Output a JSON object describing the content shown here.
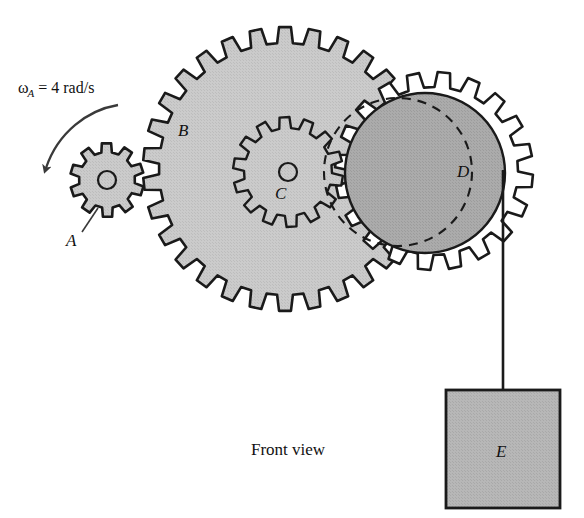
{
  "figure": {
    "caption": "Front view",
    "angular_velocity_label": {
      "symbol": "ω",
      "subscript": "A",
      "equals_value": "= 4 rad/s",
      "full_text": "ωA = 4 rad/s"
    },
    "labels": {
      "gear_a": "A",
      "gear_b": "B",
      "gear_c": "C",
      "drum_d": "D",
      "block_e": "E"
    },
    "colors": {
      "outline": "#1a1a1a",
      "gear_fill": "#c8c8c8",
      "drum_fill": "#a8a8a8",
      "block_fill": "#b4b4b4",
      "background": "#ffffff"
    },
    "components": [
      {
        "name": "gear-a",
        "label": "A",
        "teeth": 10,
        "center_x": 107,
        "center_y": 180,
        "outer_radius": 37,
        "root_radius": 28,
        "hub_radius": 9,
        "fill": "#c8c8c8"
      },
      {
        "name": "gear-b",
        "label": "B",
        "teeth": 30,
        "center_x": 285,
        "center_y": 169,
        "outer_radius": 142,
        "root_radius": 126,
        "fill": "#c8c8c8"
      },
      {
        "name": "gear-c",
        "label": "C",
        "teeth": 14,
        "center_x": 288,
        "center_y": 177,
        "outer_radius": 55,
        "root_radius": 44,
        "hub_radius": 8,
        "fill": "#c8c8c8"
      },
      {
        "name": "gear-ring-d",
        "label": "D",
        "teeth": 20,
        "center_x": 434,
        "center_y": 171,
        "outer_radius": 99,
        "root_radius": 84,
        "fill": "#ffffff"
      },
      {
        "name": "drum-d",
        "label": "D",
        "center_x": 425,
        "center_y": 173,
        "radius": 80,
        "fill": "#a8a8a8"
      },
      {
        "name": "pitch-circle-dashed",
        "center_x": 398,
        "center_y": 172,
        "radius": 74,
        "style": "dashed"
      },
      {
        "name": "block-e",
        "label": "E",
        "x": 446,
        "y": 390,
        "width": 114,
        "height": 118,
        "fill": "#b4b4b4"
      },
      {
        "name": "cord",
        "from_x": 503,
        "from_y": 185,
        "to_x": 503,
        "to_y": 390
      },
      {
        "name": "rotation-arrow",
        "direction": "counterclockwise",
        "start_x": 116,
        "start_y": 106,
        "end_x": 45,
        "end_y": 176
      }
    ]
  }
}
